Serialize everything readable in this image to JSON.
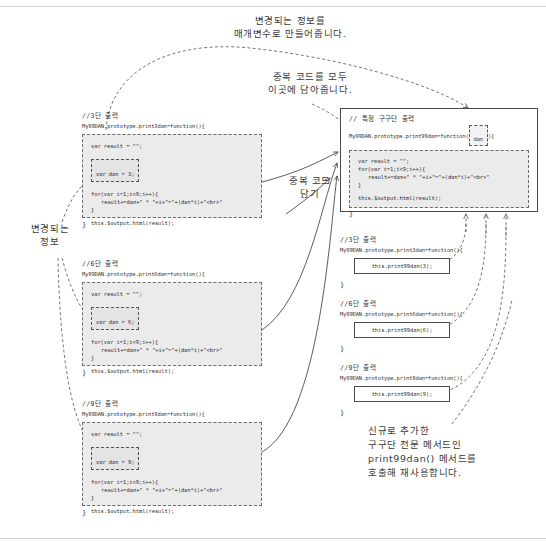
{
  "page": {
    "width": 546,
    "height": 551,
    "background": "#ffffff",
    "line_color": "#cfcfcf"
  },
  "annotations": {
    "top": "변경되는 정보를\n매개변수로 만들어줍니다.",
    "duplicate_all": "중복 코드를 모두\n이곳에 담아줍니다.",
    "duplicate_put": "중복 코드\n담기",
    "changing_info": "변경되는\n정보",
    "bottom_right": "신규로 추가한\n구구단 전문 메서드인\nprint99dan() 메서드를\n호출해 재사용합니다."
  },
  "left_blocks": [
    {
      "comment": "//3단 출력",
      "signature": "My99DAN.prototype.print3dan=function(){",
      "result_line": "var result = \"\";",
      "dan_line": "var dan = 3;",
      "for_line": "for(var i=1;i<9;i++){",
      "body_line": "result+=dan+\" * \"+i+\"=\"+(dan*i)+\"<br>\"",
      "for_close": "}",
      "output_line": "this.$output.html(result);",
      "close": "}"
    },
    {
      "comment": "//6단 출력",
      "signature": "My99DAN.prototype.print6dan=function(){",
      "result_line": "var result = \"\";",
      "dan_line": "var dan = 6;",
      "for_line": "for(var i=1;i<9;i++){",
      "body_line": "result+=dan+\" * \"+i+\"=\"+(dan*i)+\"<br>\"",
      "for_close": "}",
      "output_line": "this.$output.html(result);",
      "close": "}"
    },
    {
      "comment": "//9단 출력",
      "signature": "My99DAN.prototype.print9dan=function(){",
      "result_line": "var result = \"\";",
      "dan_line": "var dan = 9;",
      "for_line": "for(var i=1;i<9;i++){",
      "body_line": "result+=dan+\" * \"+i+\"=\"+(dan*i)+\"<br>\"",
      "for_close": "}",
      "output_line": "this.$output.html(result);",
      "close": "}"
    }
  ],
  "main_block": {
    "comment": "// 특정 구구단 출력",
    "signature_prefix": "My99DAN.prototype.print99dan=function(",
    "param": "dan",
    "signature_suffix": "){",
    "result_line": "var result = \"\";",
    "for_line": "for(var i=1;i<9;i++){",
    "body_line": "result+=dan+\" * \"+i+\"=\"+(dan*i)+\"<br>\"",
    "for_close": "}",
    "output_line": "this.$output.html(result);",
    "close": "}"
  },
  "call_blocks": [
    {
      "comment": "//3단 출력",
      "signature": "My99DAN.prototype.print3dan=function(){",
      "call": "this.print99dan(3);",
      "close": "}"
    },
    {
      "comment": "//6단 출력",
      "signature": "My99DAN.prototype.print6dan=function(){",
      "call": "this.print99dan(6);",
      "close": "}"
    },
    {
      "comment": "//9단 출력",
      "signature": "My99DAN.prototype.print9dan=function(){",
      "call": "this.print99dan(9);",
      "close": "}"
    }
  ]
}
